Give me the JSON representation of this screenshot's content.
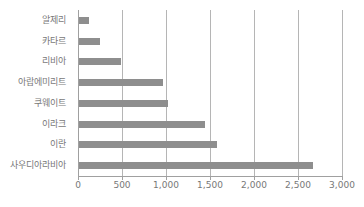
{
  "chart_data": {
    "type": "bar",
    "orientation": "horizontal",
    "title": "",
    "xlabel": "",
    "ylabel": "",
    "categories": [
      "알제리",
      "카타르",
      "리비아",
      "아랍에미리트",
      "쿠웨이트",
      "이라크",
      "이란",
      "사우디아라비아"
    ],
    "values": [
      115,
      240,
      480,
      960,
      1010,
      1430,
      1570,
      2660
    ],
    "xlim": [
      0,
      3000
    ],
    "x_ticks": [
      0,
      500,
      1000,
      1500,
      2000,
      2500,
      3000
    ],
    "x_tick_labels": [
      "0",
      "500",
      "1,000",
      "1,500",
      "2,000",
      "2,500",
      "3,000"
    ],
    "grid": "vertical-only",
    "legend": "none",
    "colors": {
      "bar": "#8e8e8e",
      "gridline": "#b5b5b5",
      "axis": "#a0a0a0",
      "label_text": "#787878",
      "background": "#ffffff"
    }
  }
}
